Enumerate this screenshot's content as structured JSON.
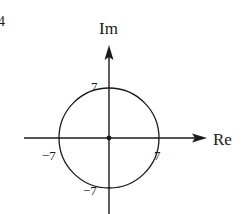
{
  "diagram": {
    "type": "complex-plane",
    "corner_mark": "4",
    "axes": {
      "imaginary_label": "Im",
      "real_label": "Re"
    },
    "origin_dot": true,
    "circle": {
      "center": [
        0,
        0
      ],
      "radius_units": 7
    },
    "tick_labels": {
      "top": "7",
      "right": "7",
      "left": "−7",
      "bottom": "−7"
    },
    "colors": {
      "ink": "#1a1a1a",
      "background": "#ffffff"
    }
  }
}
